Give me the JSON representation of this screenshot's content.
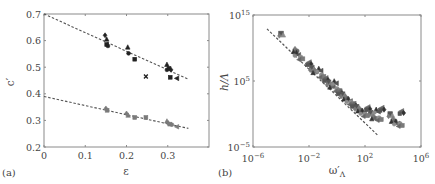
{
  "figure": {
    "panels": [
      {
        "id": "a",
        "label": "(a)"
      },
      {
        "id": "b",
        "label": "(b)"
      }
    ],
    "colors": {
      "frame": "#8a8a8a",
      "text": "#444444",
      "black_series": "#222222",
      "gray_series": "#7a7a7a",
      "fit_line": "#555555"
    }
  },
  "chart_data": [
    {
      "panel": "(a)",
      "type": "scatter",
      "title": "",
      "xlabel": "ε",
      "ylabel": "c′",
      "xlim": [
        0,
        0.4
      ],
      "ylim": [
        0.2,
        0.7
      ],
      "xticks": [
        0,
        0.1,
        0.2,
        0.3
      ],
      "xtick_labels": [
        "0",
        "0.1",
        "0.2",
        "0.3"
      ],
      "yticks": [
        0.2,
        0.3,
        0.4,
        0.5,
        0.6,
        0.7
      ],
      "ytick_labels": [
        "0.2",
        "0.3",
        "0.4",
        "0.5",
        "0.6",
        "0.7"
      ],
      "grid": false,
      "legend": null,
      "series": [
        {
          "name": "upper (black markers)",
          "color": "#222222",
          "points": [
            {
              "x": 0.148,
              "y": 0.62,
              "marker": "diamond"
            },
            {
              "x": 0.152,
              "y": 0.605,
              "marker": "triangle-up"
            },
            {
              "x": 0.152,
              "y": 0.585,
              "marker": "square"
            },
            {
              "x": 0.155,
              "y": 0.58,
              "marker": "circle"
            },
            {
              "x": 0.203,
              "y": 0.575,
              "marker": "triangle-up"
            },
            {
              "x": 0.205,
              "y": 0.552,
              "marker": "circle"
            },
            {
              "x": 0.22,
              "y": 0.53,
              "marker": "square"
            },
            {
              "x": 0.247,
              "y": 0.465,
              "marker": "x"
            },
            {
              "x": 0.298,
              "y": 0.51,
              "marker": "triangle-up"
            },
            {
              "x": 0.298,
              "y": 0.49,
              "marker": "circle"
            },
            {
              "x": 0.303,
              "y": 0.495,
              "marker": "square"
            },
            {
              "x": 0.308,
              "y": 0.49,
              "marker": "diamond"
            },
            {
              "x": 0.306,
              "y": 0.462,
              "marker": "square"
            },
            {
              "x": 0.322,
              "y": 0.458,
              "marker": "triangle-left"
            }
          ],
          "fit_line": {
            "x": [
              0,
              0.35
            ],
            "y": [
              0.7,
              0.455
            ],
            "style": "dashed"
          }
        },
        {
          "name": "lower (gray markers)",
          "color": "#7a7a7a",
          "points": [
            {
              "x": 0.15,
              "y": 0.345,
              "marker": "diamond"
            },
            {
              "x": 0.153,
              "y": 0.338,
              "marker": "square"
            },
            {
              "x": 0.2,
              "y": 0.326,
              "marker": "diamond"
            },
            {
              "x": 0.204,
              "y": 0.319,
              "marker": "triangle-up"
            },
            {
              "x": 0.22,
              "y": 0.311,
              "marker": "square"
            },
            {
              "x": 0.247,
              "y": 0.311,
              "marker": "square"
            },
            {
              "x": 0.298,
              "y": 0.297,
              "marker": "triangle-up"
            },
            {
              "x": 0.301,
              "y": 0.29,
              "marker": "diamond"
            },
            {
              "x": 0.305,
              "y": 0.286,
              "marker": "square"
            },
            {
              "x": 0.31,
              "y": 0.284,
              "marker": "circle"
            },
            {
              "x": 0.322,
              "y": 0.276,
              "marker": "triangle-left"
            }
          ],
          "fit_line": {
            "x": [
              0,
              0.35
            ],
            "y": [
              0.39,
              0.27
            ],
            "style": "dashed"
          }
        }
      ]
    },
    {
      "panel": "(b)",
      "type": "scatter",
      "title": "",
      "xlabel": "ω′Λ",
      "ylabel": "h/Λ",
      "xscale": "log",
      "yscale": "log",
      "xlim": [
        1e-06,
        1000000.0
      ],
      "ylim": [
        1e-05,
        1000000000000000.0
      ],
      "xticks": [
        1e-06,
        0.01,
        100.0,
        1000000.0
      ],
      "xtick_labels": [
        "10^-6",
        "10^-2",
        "10^2",
        "10^6"
      ],
      "yticks": [
        1e-05,
        100000.0,
        1000000000000000.0
      ],
      "ytick_labels": [
        "10^-5",
        "10^5",
        "10^15"
      ],
      "grid": false,
      "legend": null,
      "series": [
        {
          "name": "data (gray/black markers, dense cloud)",
          "color": "#666666",
          "points_log10": [
            {
              "x": -4.0,
              "y": 12.2
            },
            {
              "x": -3.0,
              "y": 9.8
            },
            {
              "x": -2.9,
              "y": 9.2
            },
            {
              "x": -2.6,
              "y": 8.6
            },
            {
              "x": -2.0,
              "y": 7.8
            },
            {
              "x": -1.8,
              "y": 7.0
            },
            {
              "x": -1.6,
              "y": 6.6
            },
            {
              "x": -1.3,
              "y": 6.8
            },
            {
              "x": -1.1,
              "y": 5.9
            },
            {
              "x": -0.8,
              "y": 5.4
            },
            {
              "x": -0.6,
              "y": 4.8
            },
            {
              "x": -0.4,
              "y": 4.4
            },
            {
              "x": -0.2,
              "y": 4.9
            },
            {
              "x": 0.0,
              "y": 3.8
            },
            {
              "x": 0.2,
              "y": 3.4
            },
            {
              "x": 0.4,
              "y": 3.0
            },
            {
              "x": 0.6,
              "y": 2.6
            },
            {
              "x": 0.8,
              "y": 2.2
            },
            {
              "x": 1.0,
              "y": 1.8
            },
            {
              "x": 1.2,
              "y": 1.5
            },
            {
              "x": 1.4,
              "y": 1.1
            },
            {
              "x": 1.6,
              "y": 0.8
            },
            {
              "x": 1.8,
              "y": 0.4
            },
            {
              "x": 2.0,
              "y": 0.0
            },
            {
              "x": 2.2,
              "y": 1.0
            },
            {
              "x": 2.4,
              "y": 0.2
            },
            {
              "x": 2.6,
              "y": -0.4
            },
            {
              "x": 2.8,
              "y": 0.6
            },
            {
              "x": 3.0,
              "y": -0.6
            },
            {
              "x": 3.2,
              "y": 0.9
            },
            {
              "x": 3.8,
              "y": 0.0
            },
            {
              "x": 4.0,
              "y": -0.8
            },
            {
              "x": 4.2,
              "y": -1.2
            },
            {
              "x": 4.5,
              "y": -1.5
            },
            {
              "x": 4.6,
              "y": 0.4
            }
          ]
        }
      ],
      "fit_line": {
        "x_log10": [
          -5.0,
          2.9
        ],
        "y_log10": [
          12.9,
          -3.2
        ],
        "style": "dashed"
      }
    }
  ]
}
